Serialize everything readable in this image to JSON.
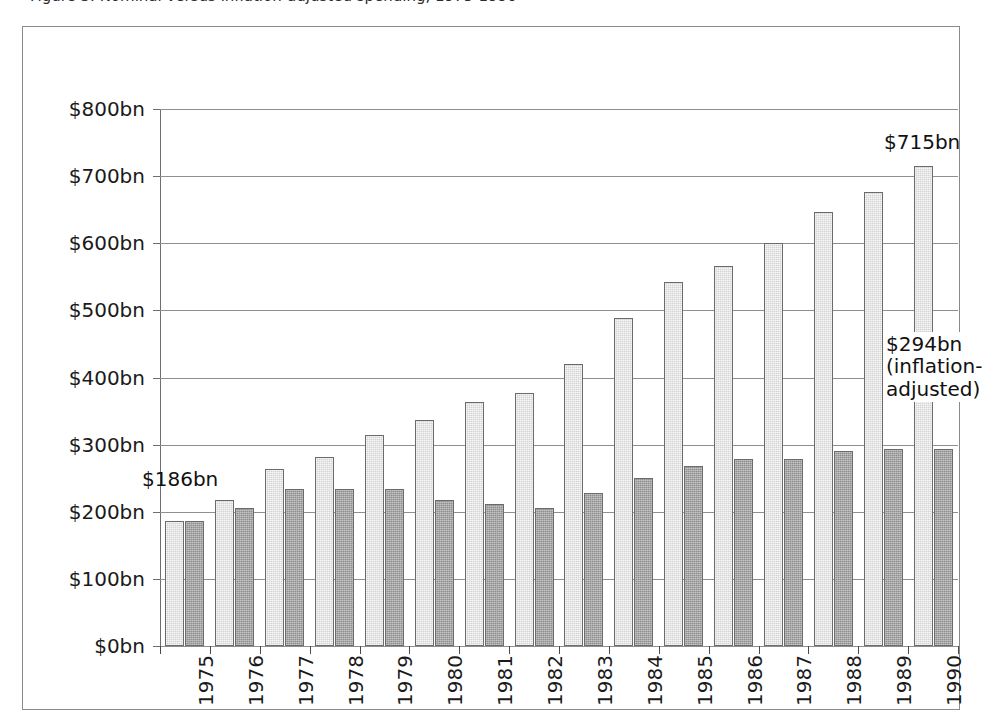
{
  "caption": {
    "text": "Figure 3. Nominal versus inflation-adjusted spending, 1975-1990"
  },
  "chart_data": {
    "type": "bar",
    "title": "",
    "subtitle": "",
    "xlabel": "",
    "ylabel": "",
    "ylim": [
      0,
      800
    ],
    "y_tick_step": 100,
    "grid": true,
    "legend_position": "none",
    "categories": [
      "1975",
      "1976",
      "1977",
      "1978",
      "1979",
      "1980",
      "1981",
      "1982",
      "1983",
      "1984",
      "1985",
      "1986",
      "1987",
      "1988",
      "1989",
      "1990"
    ],
    "y_tick_labels": [
      "$0bn",
      "$100bn",
      "$200bn",
      "$300bn",
      "$400bn",
      "$500bn",
      "$600bn",
      "$700bn",
      "$800bn"
    ],
    "y_tick_values": [
      0,
      100,
      200,
      300,
      400,
      500,
      600,
      700,
      800
    ],
    "series": [
      {
        "name": "Nominal",
        "color": "#d3d3d3",
        "values": [
          186,
          218,
          263,
          281,
          314,
          336,
          364,
          377,
          420,
          488,
          543,
          566,
          600,
          647,
          677,
          715
        ]
      },
      {
        "name": "Inflation-adjusted",
        "color": "#8e8e8e",
        "values": [
          186,
          206,
          234,
          234,
          234,
          218,
          211,
          205,
          228,
          250,
          268,
          279,
          279,
          290,
          293,
          294
        ]
      }
    ],
    "annotations": [
      {
        "id": "annotation-186",
        "lines": [
          "$186bn"
        ],
        "category": "1975",
        "value": 186
      },
      {
        "id": "annotation-715",
        "lines": [
          "$715bn"
        ],
        "category": "1990",
        "value": 715
      },
      {
        "id": "annotation-294",
        "lines": [
          "$294bn",
          "(inflation-",
          "adjusted)"
        ],
        "category": "1990",
        "value": 294
      }
    ]
  }
}
